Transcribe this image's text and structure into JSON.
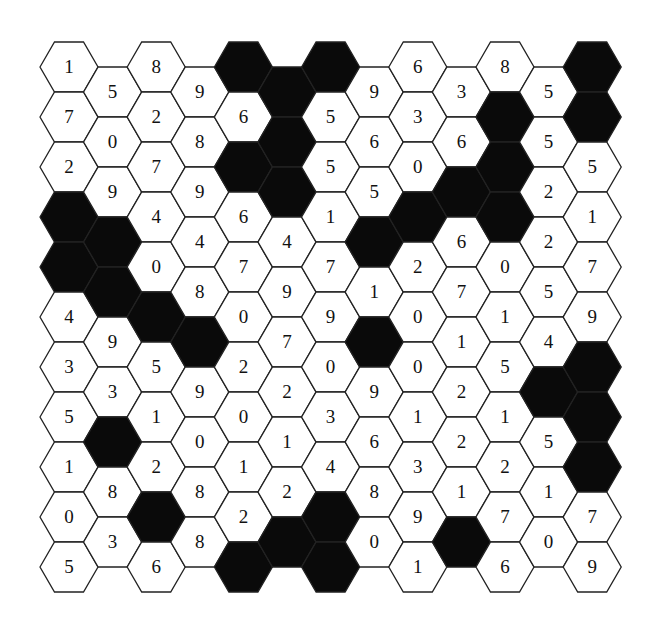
{
  "puzzle": {
    "type": "hex-grid",
    "columns": 13,
    "layout": "flat-top hexagons in columns; even columns start higher",
    "colors": {
      "filled": "#0a0a0a",
      "empty": "#ffffff",
      "stroke": "#222222",
      "text": "#111111"
    },
    "legend": {
      "B": "filled black cell"
    },
    "cells_by_column": [
      [
        "1",
        "7",
        "2",
        "B",
        "B",
        "4",
        "3",
        "5",
        "1",
        "0",
        "5"
      ],
      [
        "5",
        "0",
        "9",
        "B",
        "B",
        "9",
        "3",
        "B",
        "8",
        "3"
      ],
      [
        "8",
        "2",
        "7",
        "4",
        "0",
        "B",
        "5",
        "1",
        "2",
        "B",
        "6"
      ],
      [
        "9",
        "8",
        "9",
        "4",
        "8",
        "B",
        "9",
        "0",
        "8",
        "8"
      ],
      [
        "B",
        "6",
        "B",
        "6",
        "7",
        "0",
        "2",
        "0",
        "1",
        "2",
        "B"
      ],
      [
        "B",
        "B",
        "B",
        "4",
        "9",
        "7",
        "2",
        "1",
        "2",
        "B"
      ],
      [
        "B",
        "5",
        "5",
        "1",
        "7",
        "9",
        "0",
        "3",
        "4",
        "B",
        "B"
      ],
      [
        "9",
        "6",
        "5",
        "B",
        "1",
        "B",
        "9",
        "6",
        "8",
        "0"
      ],
      [
        "6",
        "3",
        "0",
        "B",
        "2",
        "0",
        "0",
        "1",
        "3",
        "9",
        "1"
      ],
      [
        "3",
        "6",
        "B",
        "6",
        "7",
        "1",
        "2",
        "2",
        "1",
        "B"
      ],
      [
        "8",
        "B",
        "B",
        "B",
        "0",
        "1",
        "5",
        "1",
        "2",
        "7",
        "6"
      ],
      [
        "5",
        "5",
        "2",
        "2",
        "5",
        "4",
        "B",
        "5",
        "1",
        "0"
      ],
      [
        "B",
        "B",
        "5",
        "1",
        "7",
        "9",
        "B",
        "B",
        "B",
        "7",
        "9"
      ]
    ]
  }
}
